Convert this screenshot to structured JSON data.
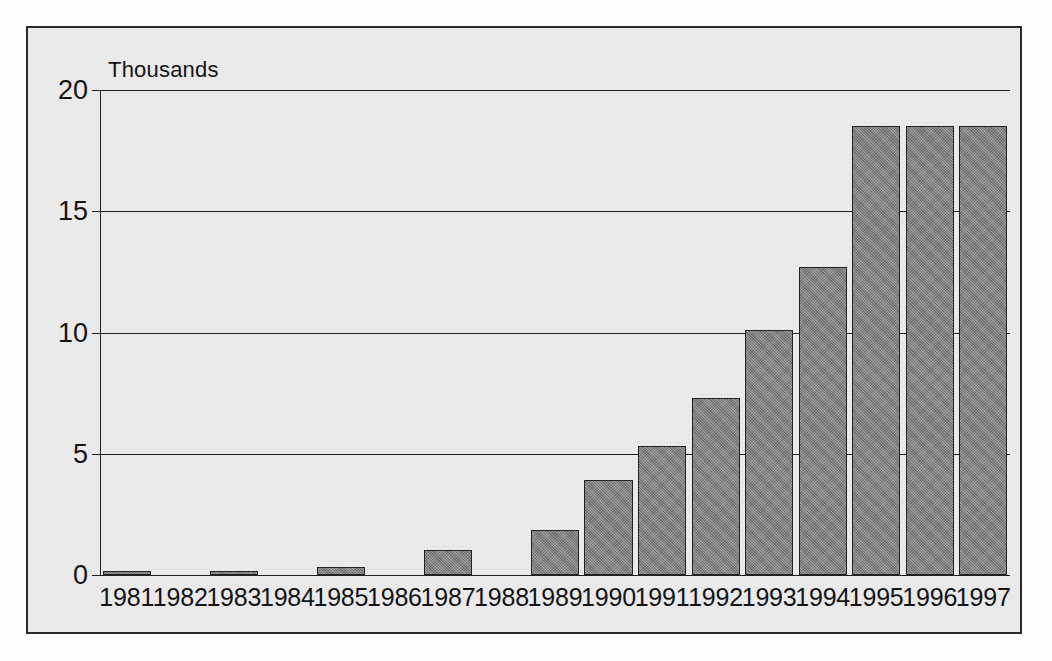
{
  "chart_data": {
    "type": "bar",
    "title": "",
    "subtitle": "",
    "axis_note": "Thousands",
    "xlabel": "",
    "ylabel": "Thousands",
    "ylim": [
      0,
      20
    ],
    "yticks": [
      0,
      5,
      10,
      15,
      20
    ],
    "ytick_labels": [
      "0",
      "5",
      "10",
      "15",
      "20"
    ],
    "grid": true,
    "grid_axis": "y",
    "legend": false,
    "legend_position": "none",
    "bar_color": "#807f80",
    "bar_edge_color": "#222224",
    "background_color": "#ececec",
    "frame_color": "#2a2a2a",
    "categories": [
      "1981",
      "1982",
      "1983",
      "1984",
      "1985",
      "1986",
      "1987",
      "1988",
      "1989",
      "1990",
      "1991",
      "1992",
      "1993",
      "1994",
      "1995",
      "1996",
      "1997"
    ],
    "values": [
      0.15,
      0,
      0.18,
      0,
      0.35,
      0,
      1.05,
      0,
      1.85,
      3.9,
      5.3,
      7.3,
      10.1,
      12.7,
      18.5,
      18.5,
      18.5
    ],
    "series": [
      {
        "name": "Value",
        "values": [
          0.15,
          0,
          0.18,
          0,
          0.35,
          0,
          1.05,
          0,
          1.85,
          3.9,
          5.3,
          7.3,
          10.1,
          12.7,
          18.5,
          18.5,
          18.5
        ]
      }
    ],
    "annotations": []
  }
}
